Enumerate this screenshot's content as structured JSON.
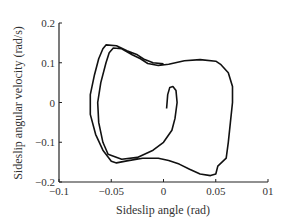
{
  "chart_data": {
    "type": "line",
    "title": "",
    "xlabel": "Sideslip angle (rad)",
    "ylabel": "Sideslip angular velocity (rad/s)",
    "xlim": [
      -0.1,
      0.1
    ],
    "ylim": [
      -0.2,
      0.2
    ],
    "xticks": [
      -0.1,
      -0.05,
      0,
      0.05,
      0.1
    ],
    "xtick_labels": [
      "-0.1",
      "-0.05",
      "0",
      "0.05",
      "01"
    ],
    "yticks": [
      -0.2,
      -0.1,
      0,
      0.1,
      0.2
    ],
    "ytick_labels": [
      "-0.2",
      "-0.1",
      "0",
      "0.1",
      "0.2"
    ],
    "grid": false,
    "legend": null,
    "series": [
      {
        "name": "phase trajectory",
        "color": "#111111",
        "points": [
          [
            0.003,
            -0.015
          ],
          [
            0.004,
            0.02
          ],
          [
            0.006,
            0.038
          ],
          [
            0.009,
            0.04
          ],
          [
            0.012,
            0.03
          ],
          [
            0.013,
            0.0
          ],
          [
            0.011,
            -0.04
          ],
          [
            0.008,
            -0.07
          ],
          [
            0.0,
            -0.1
          ],
          [
            -0.01,
            -0.12
          ],
          [
            -0.025,
            -0.138
          ],
          [
            -0.04,
            -0.143
          ],
          [
            -0.053,
            -0.13
          ],
          [
            -0.058,
            -0.1
          ],
          [
            -0.062,
            -0.05
          ],
          [
            -0.063,
            0.0
          ],
          [
            -0.06,
            0.05
          ],
          [
            -0.055,
            0.1
          ],
          [
            -0.052,
            0.125
          ],
          [
            -0.048,
            0.137
          ],
          [
            -0.04,
            0.135
          ],
          [
            -0.03,
            0.12
          ],
          [
            -0.022,
            0.11
          ],
          [
            -0.015,
            0.098
          ],
          [
            -0.005,
            0.093
          ],
          [
            0.005,
            0.096
          ],
          [
            0.02,
            0.105
          ],
          [
            0.035,
            0.108
          ],
          [
            0.05,
            0.104
          ],
          [
            0.055,
            0.095
          ],
          [
            0.062,
            0.075
          ],
          [
            0.066,
            0.04
          ],
          [
            0.066,
            0.0
          ],
          [
            0.064,
            -0.05
          ],
          [
            0.062,
            -0.1
          ],
          [
            0.06,
            -0.14
          ],
          [
            0.052,
            -0.16
          ],
          [
            0.05,
            -0.18
          ],
          [
            0.045,
            -0.184
          ],
          [
            0.035,
            -0.18
          ],
          [
            0.025,
            -0.168
          ],
          [
            0.015,
            -0.155
          ],
          [
            0.005,
            -0.146
          ],
          [
            -0.005,
            -0.14
          ],
          [
            -0.02,
            -0.14
          ],
          [
            -0.035,
            -0.147
          ],
          [
            -0.045,
            -0.152
          ],
          [
            -0.05,
            -0.148
          ],
          [
            -0.058,
            -0.12
          ],
          [
            -0.065,
            -0.08
          ],
          [
            -0.07,
            -0.03
          ],
          [
            -0.07,
            0.02
          ],
          [
            -0.066,
            0.07
          ],
          [
            -0.062,
            0.11
          ],
          [
            -0.058,
            0.135
          ],
          [
            -0.055,
            0.145
          ],
          [
            -0.045,
            0.143
          ],
          [
            -0.035,
            0.13
          ],
          [
            -0.025,
            0.12
          ],
          [
            -0.018,
            0.108
          ],
          [
            -0.01,
            0.1
          ],
          [
            0.0,
            0.097
          ]
        ]
      }
    ]
  }
}
